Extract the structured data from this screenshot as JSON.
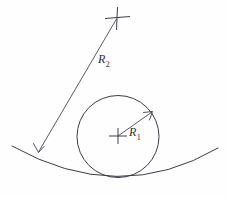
{
  "diagram": {
    "background_color": "#fefefe",
    "stroke_color": "#3c3c45",
    "text_color": "#2e2e36",
    "labels": {
      "r1_base": "R",
      "r1_subscript": "1",
      "r2_base": "R",
      "r2_subscript": "2"
    },
    "geometry": {
      "small_circle": {
        "center_x": 118,
        "center_y": 136,
        "radius": 41
      },
      "large_arc": {
        "left_end_x": 12,
        "left_end_y": 146,
        "right_end_x": 218,
        "right_end_y": 148,
        "lowest_x": 120,
        "lowest_y": 178,
        "radius": 190
      },
      "large_arc_center_mark": {
        "x": 117,
        "y": 17
      },
      "r1_arrow": {
        "from_x": 118,
        "from_y": 136,
        "to_x": 152,
        "to_y": 112
      },
      "r2_arrow": {
        "from_x": 117,
        "from_y": 18,
        "to_x": 38,
        "to_y": 153
      }
    }
  }
}
